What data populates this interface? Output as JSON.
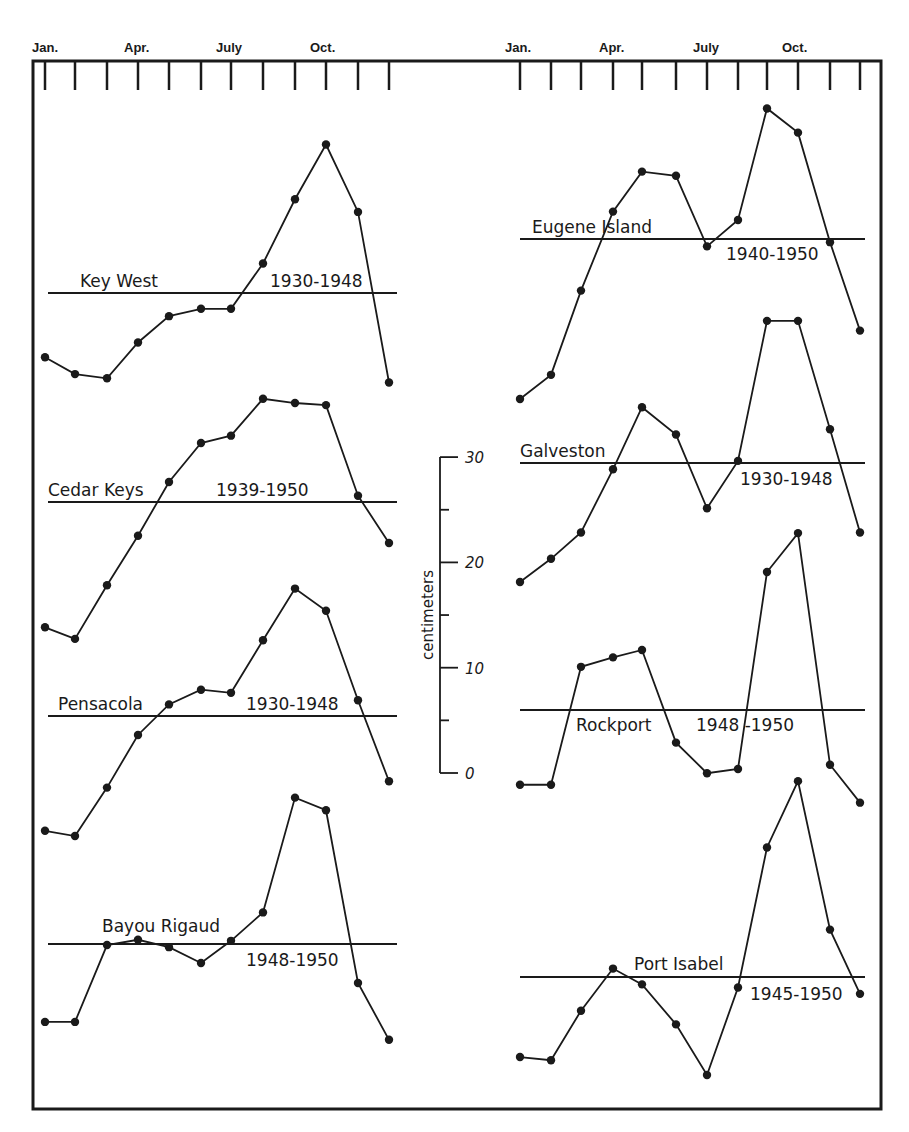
{
  "chart_data": {
    "type": "line",
    "title": "",
    "xlabel": "",
    "ylabel": "centimeters",
    "x_tick_labels": [
      "Jan.",
      "Apr.",
      "July",
      "Oct."
    ],
    "x": [
      "Jan",
      "Feb",
      "Mar",
      "Apr",
      "May",
      "Jun",
      "Jul",
      "Aug",
      "Sep",
      "Oct",
      "Nov",
      "Dec"
    ],
    "scale_bar": {
      "label": "centimeters",
      "ticks": [
        0,
        5,
        10,
        15,
        20,
        25,
        30
      ],
      "labeled_ticks": [
        "30",
        "20",
        "10",
        "0"
      ]
    },
    "note": "Values are monthly deviations from the mean level (horizontal line) in cm, estimated from the scale bar.",
    "grid": false,
    "legend": "none",
    "panels": [
      {
        "column": "left",
        "series": [
          {
            "name": "Key West",
            "period": "1930-1948",
            "mean_y": 293,
            "label_x": 80,
            "label_y": 287,
            "period_x": 270,
            "period_y": 287,
            "values": [
              -6.1,
              -7.7,
              -8.1,
              -4.7,
              -2.2,
              -1.5,
              -1.5,
              2.8,
              8.9,
              14.1,
              7.7,
              -8.5
            ]
          },
          {
            "name": "Cedar Keys",
            "period": "1939-1950",
            "mean_y": 502,
            "label_x": 48,
            "label_y": 496,
            "period_x": 216,
            "period_y": 496,
            "values": [
              -11.9,
              -13.0,
              -7.9,
              -3.2,
              1.9,
              5.6,
              6.3,
              9.8,
              9.4,
              9.2,
              0.6,
              -3.9
            ]
          },
          {
            "name": "Pensacola",
            "period": "1930-1948",
            "mean_y": 716,
            "label_x": 58,
            "label_y": 710,
            "period_x": 246,
            "period_y": 710,
            "values": [
              -10.9,
              -11.4,
              -6.8,
              -1.8,
              1.1,
              2.5,
              2.2,
              7.2,
              12.1,
              10.0,
              1.5,
              -6.2
            ]
          },
          {
            "name": "Bayou Rigaud",
            "period": "1948-1950",
            "mean_y": 944,
            "label_x": 102,
            "label_y": 932,
            "period_x": 246,
            "period_y": 966,
            "values": [
              -7.4,
              -7.4,
              -0.1,
              0.4,
              -0.3,
              -1.8,
              0.3,
              3.0,
              13.9,
              12.7,
              -3.7,
              -9.1
            ]
          }
        ]
      },
      {
        "column": "right",
        "series": [
          {
            "name": "Eugene Island",
            "period": "1940-1950",
            "mean_y": 239,
            "label_x": 532,
            "label_y": 233,
            "period_x": 726,
            "period_y": 260,
            "values": [
              -15.2,
              -12.9,
              -4.9,
              2.6,
              6.4,
              6.0,
              -0.7,
              1.8,
              12.4,
              10.1,
              -0.3,
              -8.7
            ]
          },
          {
            "name": "Galveston",
            "period": "1930-1948",
            "mean_y": 463,
            "label_x": 520,
            "label_y": 457,
            "period_x": 740,
            "period_y": 485,
            "values": [
              -11.3,
              -9.1,
              -6.6,
              -0.6,
              5.3,
              2.7,
              -4.3,
              0.2,
              13.5,
              13.5,
              3.2,
              -6.6
            ]
          },
          {
            "name": "Rockport",
            "period": "1948 -1950",
            "mean_y": 710,
            "label_x": 576,
            "label_y": 731,
            "period_x": 696,
            "period_y": 731,
            "values": [
              -7.1,
              -7.1,
              4.1,
              5.0,
              5.7,
              -3.1,
              -6.0,
              -5.6,
              13.1,
              16.8,
              -5.2,
              -8.8
            ]
          },
          {
            "name": "Port Isabel",
            "period": "1945-1950",
            "mean_y": 977,
            "label_x": 634,
            "label_y": 970,
            "period_x": 750,
            "period_y": 1000,
            "values": [
              -7.6,
              -7.9,
              -3.2,
              0.8,
              -0.7,
              -4.5,
              -9.3,
              -1.0,
              12.3,
              18.6,
              4.5,
              -1.6
            ]
          }
        ]
      }
    ]
  },
  "layout": {
    "px_per_cm": 10.53,
    "left_month_x": [
      45,
      75,
      107,
      138,
      169,
      201,
      231,
      263,
      295,
      326,
      358,
      389
    ],
    "right_month_x": [
      520,
      551,
      581,
      613,
      642,
      676,
      707,
      738,
      767,
      798,
      830,
      860
    ],
    "left_mean_line": [
      48,
      397
    ],
    "right_mean_line": [
      520,
      865
    ],
    "month_labels_left": [
      {
        "text": "Jan.",
        "x": 32
      },
      {
        "text": "Apr.",
        "x": 124
      },
      {
        "text": "July",
        "x": 216
      },
      {
        "text": "Oct.",
        "x": 310
      }
    ],
    "month_labels_right": [
      {
        "text": "Jan.",
        "x": 505
      },
      {
        "text": "Apr.",
        "x": 599
      },
      {
        "text": "July",
        "x": 693
      },
      {
        "text": "Oct.",
        "x": 782
      }
    ]
  }
}
